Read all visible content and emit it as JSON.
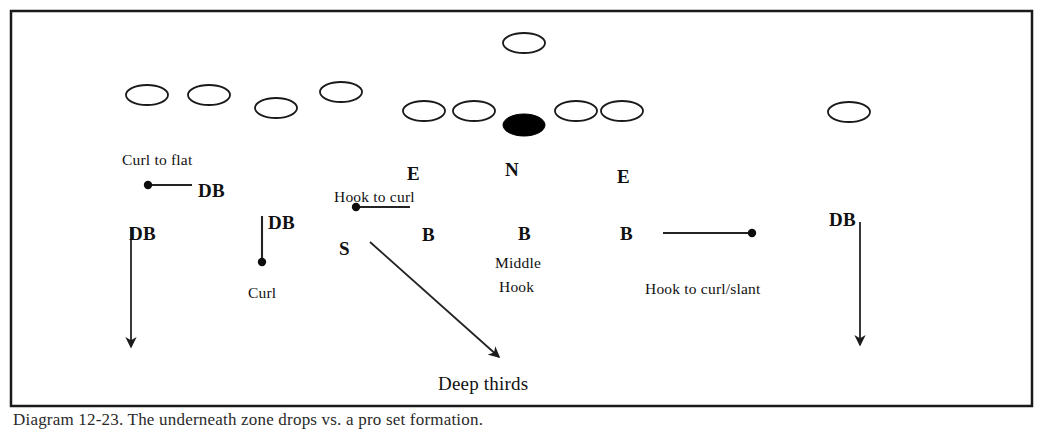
{
  "figure": {
    "frame": {
      "x": 11,
      "y": 11,
      "width": 1021,
      "height": 395,
      "stroke": "#1a1a1a",
      "stroke_width": 2.5,
      "fill": "#ffffff"
    }
  },
  "colors": {
    "ink": "#111111",
    "line": "#2b2b2b",
    "fill_offense": "#ffffff",
    "fill_ball": "#000000",
    "frame": "#1a1a1a",
    "page": "#ffffff"
  },
  "players": [
    {
      "name": "player-qb",
      "label": "",
      "cx": 524,
      "cy": 43,
      "rx": 21,
      "ry": 10,
      "filled": false
    },
    {
      "name": "player-wr-left-1",
      "label": "",
      "cx": 147,
      "cy": 95,
      "rx": 21,
      "ry": 10,
      "filled": false
    },
    {
      "name": "player-wr-left-2",
      "label": "",
      "cx": 209,
      "cy": 95,
      "rx": 21,
      "ry": 10,
      "filled": false
    },
    {
      "name": "player-ol-left-1",
      "label": "",
      "cx": 276,
      "cy": 108,
      "rx": 21,
      "ry": 10,
      "filled": false
    },
    {
      "name": "player-te-left",
      "label": "",
      "cx": 341,
      "cy": 92,
      "rx": 21,
      "ry": 10,
      "filled": false
    },
    {
      "name": "player-ol-left-2",
      "label": "",
      "cx": 424,
      "cy": 111,
      "rx": 21,
      "ry": 10,
      "filled": false
    },
    {
      "name": "player-ol-left-3",
      "label": "",
      "cx": 474,
      "cy": 111,
      "rx": 21,
      "ry": 10,
      "filled": false
    },
    {
      "name": "player-center-ball",
      "label": "",
      "cx": 524,
      "cy": 125,
      "rx": 21,
      "ry": 11,
      "filled": true
    },
    {
      "name": "player-ol-right-1",
      "label": "",
      "cx": 576,
      "cy": 111,
      "rx": 21,
      "ry": 10,
      "filled": false
    },
    {
      "name": "player-ol-right-2",
      "label": "",
      "cx": 622,
      "cy": 111,
      "rx": 21,
      "ry": 10,
      "filled": false
    },
    {
      "name": "player-wr-right",
      "label": "",
      "cx": 849,
      "cy": 112,
      "rx": 21,
      "ry": 10,
      "filled": false
    }
  ],
  "position_labels": [
    {
      "name": "position-label-e-left",
      "text": "E",
      "x": 407,
      "y": 164,
      "style": "bold"
    },
    {
      "name": "position-label-n",
      "text": "N",
      "x": 505,
      "y": 160,
      "style": "bold"
    },
    {
      "name": "position-label-e-right",
      "text": "E",
      "x": 617,
      "y": 167,
      "style": "bold"
    },
    {
      "name": "position-label-db-1",
      "text": "DB",
      "x": 198,
      "y": 181,
      "style": "bold"
    },
    {
      "name": "position-label-db-2",
      "text": "DB",
      "x": 268,
      "y": 213,
      "style": "bold"
    },
    {
      "name": "position-label-db-3",
      "text": "DB",
      "x": 129,
      "y": 224,
      "style": "bold"
    },
    {
      "name": "position-label-db-4",
      "text": "DB",
      "x": 829,
      "y": 210,
      "style": "bold"
    },
    {
      "name": "position-label-b-left",
      "text": "B",
      "x": 422,
      "y": 225,
      "style": "bold"
    },
    {
      "name": "position-label-b-mid",
      "text": "B",
      "x": 518,
      "y": 224,
      "style": "bold"
    },
    {
      "name": "position-label-b-right",
      "text": "B",
      "x": 620,
      "y": 224,
      "style": "bold"
    },
    {
      "name": "position-label-s",
      "text": "S",
      "x": 339,
      "y": 239,
      "style": "bold"
    }
  ],
  "assignment_labels": [
    {
      "name": "assignment-curl-to-flat",
      "text": "Curl to flat",
      "x": 122,
      "y": 152,
      "style": "regular"
    },
    {
      "name": "assignment-hook-to-curl",
      "text": "Hook to curl",
      "x": 334,
      "y": 189,
      "style": "regular"
    },
    {
      "name": "assignment-curl",
      "text": "Curl",
      "x": 248,
      "y": 285,
      "style": "regular"
    },
    {
      "name": "assignment-middle",
      "text": "Middle",
      "x": 495,
      "y": 255,
      "style": "regular"
    },
    {
      "name": "assignment-hook",
      "text": "Hook",
      "x": 499,
      "y": 279,
      "style": "regular"
    },
    {
      "name": "assignment-hook-to-curl-slant",
      "text": "Hook to curl/slant",
      "x": 645,
      "y": 281,
      "style": "regular"
    },
    {
      "name": "assignment-deep-thirds",
      "text": "Deep thirds",
      "x": 438,
      "y": 374,
      "style": "deep"
    }
  ],
  "routes": [
    {
      "name": "route-curl-to-flat",
      "kind": "dot-line",
      "description": "DB curl to flat, horizontal stem left of DB label",
      "dot": {
        "x": 148,
        "y": 185
      },
      "line": {
        "x1": 148,
        "y1": 185,
        "x2": 192,
        "y2": 185
      }
    },
    {
      "name": "route-hook-to-curl",
      "kind": "dot-line",
      "description": "E hook to curl, horizontal stem",
      "dot": {
        "x": 356,
        "y": 207
      },
      "line": {
        "x1": 356,
        "y1": 207,
        "x2": 410,
        "y2": 207
      }
    },
    {
      "name": "route-curl-db",
      "kind": "dot-line",
      "description": "DB curl, short vertical stem with dot at bottom",
      "dot": {
        "x": 262,
        "y": 262
      },
      "line": {
        "x1": 262,
        "y1": 262,
        "x2": 262,
        "y2": 216
      }
    },
    {
      "name": "route-hook-to-curl-slant",
      "kind": "dot-line",
      "description": "B hook to curl/slant, horizontal stem right of B label",
      "dot": {
        "x": 752,
        "y": 233
      },
      "line": {
        "x1": 663,
        "y1": 233,
        "x2": 752,
        "y2": 233
      }
    },
    {
      "name": "route-db-deep-left",
      "kind": "arrow",
      "description": "left DB vertical deep drop arrow",
      "line": {
        "x1": 131,
        "y1": 228,
        "x2": 131,
        "y2": 347
      }
    },
    {
      "name": "route-db-deep-right",
      "kind": "arrow",
      "description": "right DB vertical deep drop arrow",
      "line": {
        "x1": 860,
        "y1": 222,
        "x2": 860,
        "y2": 345
      }
    },
    {
      "name": "route-s-deep-thirds",
      "kind": "arrow",
      "description": "S diagonal arrow down-right to Deep thirds",
      "line": {
        "x1": 370,
        "y1": 242,
        "x2": 499,
        "y2": 357
      }
    }
  ],
  "caption": {
    "name": "figure-caption",
    "text": "Diagram 12-23. The underneath zone drops vs. a pro set formation."
  }
}
